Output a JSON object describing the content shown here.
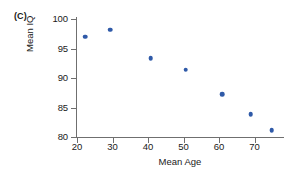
{
  "panel": {
    "label": "(C)"
  },
  "chart_data": {
    "type": "scatter",
    "title": "",
    "subtitle": "",
    "xlabel": "Mean Age",
    "ylabel": "Mean IQ",
    "xlim": [
      20,
      76
    ],
    "ylim": [
      80,
      100.8
    ],
    "xticks": [
      20,
      30,
      40,
      50,
      60,
      70
    ],
    "yticks": [
      80,
      85,
      90,
      95,
      100
    ],
    "xtick_labels": [
      "20",
      "30",
      "40",
      "50",
      "60",
      "70"
    ],
    "ytick_labels": [
      "80",
      "85",
      "90",
      "95",
      "100"
    ],
    "grid": false,
    "legend": null,
    "legend_position": "none",
    "marker": {
      "shape": "circle",
      "color": "#2f5aa8",
      "size": 4.6
    },
    "annotations": [],
    "x": [
      22.3,
      29.3,
      40.8,
      50.6,
      60.9,
      68.9,
      74.8
    ],
    "y": [
      97.0,
      98.2,
      93.4,
      91.4,
      87.3,
      83.9,
      81.2
    ],
    "points": [
      {
        "x": 22.3,
        "y": 97.0
      },
      {
        "x": 29.3,
        "y": 98.2
      },
      {
        "x": 40.8,
        "y": 93.4
      },
      {
        "x": 50.6,
        "y": 91.4
      },
      {
        "x": 60.9,
        "y": 87.3
      },
      {
        "x": 68.9,
        "y": 83.9
      },
      {
        "x": 74.8,
        "y": 81.2
      }
    ]
  },
  "colors": {
    "marker": "#2f5aa8",
    "axis": "#6f6f6f",
    "text": "#1a1a1a",
    "background": "#ffffff"
  }
}
